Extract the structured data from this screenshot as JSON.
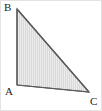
{
  "figure": {
    "name": "triangle-abc",
    "canvas": {
      "width": 102,
      "height": 111,
      "background": "#ffffff",
      "border_color": "#e3e3e3"
    },
    "style": {
      "fill_color": "#e9e9e9",
      "hatch_color": "#d5d5d5",
      "hatch_direction": "vertical",
      "hatch_spacing": 2,
      "stroke_color": "#5a5a5a",
      "stroke_width": 1.2
    },
    "vertices": [
      {
        "id": "B",
        "label": "B",
        "x": 16,
        "y": 8,
        "label_x": 3,
        "label_y": 1
      },
      {
        "id": "A",
        "label": "A",
        "x": 16,
        "y": 84,
        "label_x": 4,
        "label_y": 85
      },
      {
        "id": "C",
        "label": "C",
        "x": 88,
        "y": 91,
        "label_x": 89,
        "label_y": 95
      }
    ],
    "edges": [
      {
        "id": "AB",
        "from": "A",
        "to": "B"
      },
      {
        "id": "BC",
        "from": "B",
        "to": "C"
      },
      {
        "id": "CA",
        "from": "C",
        "to": "A"
      }
    ],
    "polygon_points": "16,8 88,91 16,84"
  }
}
